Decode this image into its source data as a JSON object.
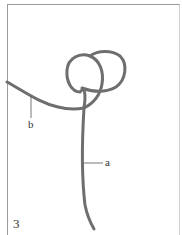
{
  "figure": {
    "step_number": "3",
    "labels": {
      "a": "a",
      "b": "b"
    },
    "rope_color": "#6b6b6b",
    "frame_color": "#9a9a9a"
  }
}
